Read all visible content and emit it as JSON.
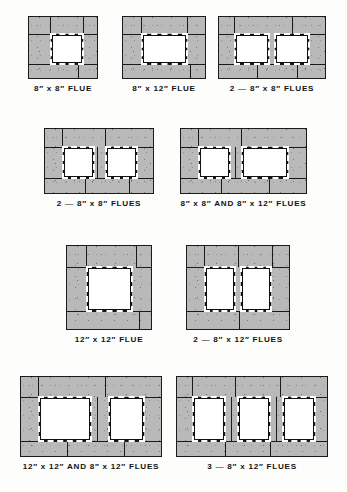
{
  "sheet": {
    "title": "Masonry Chimney Flue Arrangements",
    "background_color": "#fdfdfb",
    "masonry_color": "#b9b9b9",
    "mortar_color": "#1a1a1a",
    "flue_color": "#ffffff"
  },
  "figures": [
    {
      "id": "fig-8x8-flue",
      "caption": "8″ x 8″ FLUE",
      "flue_count": 1,
      "flue_sizes": [
        "8″ x 8″"
      ],
      "x": 28,
      "y": 16,
      "w": 70,
      "h": 63,
      "flues": [
        {
          "x": 22,
          "y": 17,
          "w": 32,
          "h": 30
        }
      ],
      "joints": [
        {
          "o": "v",
          "x": 21,
          "y": 0,
          "len": 17
        },
        {
          "o": "h",
          "x": 0,
          "y": 17,
          "len": 22
        },
        {
          "o": "v",
          "x": 54,
          "y": 0,
          "len": 17
        },
        {
          "o": "h",
          "x": 54,
          "y": 17,
          "len": 16
        },
        {
          "o": "h",
          "x": 0,
          "y": 47,
          "len": 22
        },
        {
          "o": "v",
          "x": 49,
          "y": 47,
          "len": 16
        },
        {
          "o": "h",
          "x": 22,
          "y": 47,
          "len": 48
        }
      ],
      "caption_y": 84
    },
    {
      "id": "fig-8x12-flue",
      "caption": "8″ x 12″ FLUE",
      "flue_count": 1,
      "flue_sizes": [
        "8″ x 12″"
      ],
      "x": 122,
      "y": 16,
      "w": 84,
      "h": 63,
      "flues": [
        {
          "x": 19,
          "y": 17,
          "w": 45,
          "h": 30
        }
      ],
      "joints": [
        {
          "o": "v",
          "x": 18,
          "y": 0,
          "len": 17
        },
        {
          "o": "h",
          "x": 0,
          "y": 17,
          "len": 19
        },
        {
          "o": "v",
          "x": 64,
          "y": 0,
          "len": 17
        },
        {
          "o": "h",
          "x": 64,
          "y": 17,
          "len": 20
        },
        {
          "o": "h",
          "x": 0,
          "y": 47,
          "len": 19
        },
        {
          "o": "h",
          "x": 19,
          "y": 47,
          "len": 65
        },
        {
          "o": "v",
          "x": 67,
          "y": 47,
          "len": 16
        }
      ],
      "caption_y": 84
    },
    {
      "id": "fig-2-8x8-flues-a",
      "caption": "2 — 8″ x 8″ FLUES",
      "flue_count": 2,
      "flue_sizes": [
        "8″ x 8″",
        "8″ x 8″"
      ],
      "x": 218,
      "y": 16,
      "w": 108,
      "h": 63,
      "flues": [
        {
          "x": 16,
          "y": 17,
          "w": 34,
          "h": 30
        },
        {
          "x": 56,
          "y": 17,
          "w": 34,
          "h": 30
        }
      ],
      "joints": [
        {
          "o": "v",
          "x": 15,
          "y": 0,
          "len": 17
        },
        {
          "o": "v",
          "x": 73,
          "y": 0,
          "len": 17
        },
        {
          "o": "h",
          "x": 0,
          "y": 17,
          "len": 16
        },
        {
          "o": "h",
          "x": 90,
          "y": 17,
          "len": 18
        },
        {
          "o": "h",
          "x": 0,
          "y": 47,
          "len": 16
        },
        {
          "o": "h",
          "x": 90,
          "y": 47,
          "len": 18
        },
        {
          "o": "h",
          "x": 16,
          "y": 47,
          "len": 74
        },
        {
          "o": "v",
          "x": 38,
          "y": 47,
          "len": 16
        },
        {
          "o": "v",
          "x": 78,
          "y": 47,
          "len": 16
        }
      ],
      "caption_y": 84
    },
    {
      "id": "fig-2-8x8-flues-b",
      "caption": "2 — 8″ x 8″ FLUES",
      "flue_count": 2,
      "flue_sizes": [
        "8″ x 8″",
        "8″ x 8″"
      ],
      "x": 44,
      "y": 128,
      "w": 110,
      "h": 66,
      "flues": [
        {
          "x": 18,
          "y": 18,
          "w": 31,
          "h": 31
        },
        {
          "x": 61,
          "y": 18,
          "w": 31,
          "h": 31
        }
      ],
      "joints": [
        {
          "o": "v",
          "x": 17,
          "y": 0,
          "len": 18
        },
        {
          "o": "v",
          "x": 60,
          "y": 0,
          "len": 18
        },
        {
          "o": "h",
          "x": 0,
          "y": 18,
          "len": 18
        },
        {
          "o": "h",
          "x": 92,
          "y": 18,
          "len": 18
        },
        {
          "o": "h",
          "x": 0,
          "y": 49,
          "len": 18
        },
        {
          "o": "h",
          "x": 92,
          "y": 49,
          "len": 18
        },
        {
          "o": "h",
          "x": 18,
          "y": 49,
          "len": 74
        },
        {
          "o": "v",
          "x": 40,
          "y": 49,
          "len": 17
        },
        {
          "o": "v",
          "x": 84,
          "y": 49,
          "len": 17
        },
        {
          "o": "v",
          "x": 52,
          "y": 18,
          "len": 31
        }
      ],
      "caption_y": 199
    },
    {
      "id": "fig-8x8-and-8x12-flues",
      "caption": "8″ x 8″ AND 8″ x 12″ FLUES",
      "flue_count": 2,
      "flue_sizes": [
        "8″ x 8″",
        "8″ x 12″"
      ],
      "x": 180,
      "y": 128,
      "w": 127,
      "h": 66,
      "flues": [
        {
          "x": 18,
          "y": 18,
          "w": 31,
          "h": 31
        },
        {
          "x": 61,
          "y": 18,
          "w": 46,
          "h": 31
        }
      ],
      "joints": [
        {
          "o": "v",
          "x": 17,
          "y": 0,
          "len": 18
        },
        {
          "o": "v",
          "x": 60,
          "y": 0,
          "len": 18
        },
        {
          "o": "h",
          "x": 0,
          "y": 18,
          "len": 18
        },
        {
          "o": "h",
          "x": 107,
          "y": 18,
          "len": 20
        },
        {
          "o": "h",
          "x": 0,
          "y": 49,
          "len": 18
        },
        {
          "o": "h",
          "x": 107,
          "y": 49,
          "len": 20
        },
        {
          "o": "h",
          "x": 18,
          "y": 49,
          "len": 89
        },
        {
          "o": "v",
          "x": 40,
          "y": 49,
          "len": 17
        },
        {
          "o": "v",
          "x": 88,
          "y": 49,
          "len": 17
        },
        {
          "o": "v",
          "x": 54,
          "y": 18,
          "len": 31
        }
      ],
      "caption_y": 199
    },
    {
      "id": "fig-12x12-flue",
      "caption": "12″ x 12″ FLUE",
      "flue_count": 1,
      "flue_sizes": [
        "12″ x 12″"
      ],
      "x": 66,
      "y": 245,
      "w": 86,
      "h": 85,
      "flues": [
        {
          "x": 20,
          "y": 21,
          "w": 45,
          "h": 44
        }
      ],
      "joints": [
        {
          "o": "v",
          "x": 19,
          "y": 0,
          "len": 21
        },
        {
          "o": "h",
          "x": 0,
          "y": 21,
          "len": 20
        },
        {
          "o": "v",
          "x": 69,
          "y": 0,
          "len": 21
        },
        {
          "o": "h",
          "x": 69,
          "y": 21,
          "len": 17
        },
        {
          "o": "h",
          "x": 0,
          "y": 65,
          "len": 20
        },
        {
          "o": "h",
          "x": 20,
          "y": 65,
          "len": 66
        },
        {
          "o": "v",
          "x": 72,
          "y": 65,
          "len": 20
        }
      ],
      "caption_y": 335
    },
    {
      "id": "fig-2-8x12-flues",
      "caption": "2 — 8″ x 12″ FLUES",
      "flue_count": 2,
      "flue_sizes": [
        "8″ x 12″",
        "8″ x 12″"
      ],
      "x": 186,
      "y": 245,
      "w": 104,
      "h": 85,
      "flues": [
        {
          "x": 18,
          "y": 21,
          "w": 30,
          "h": 44
        },
        {
          "x": 54,
          "y": 21,
          "w": 30,
          "h": 44
        }
      ],
      "joints": [
        {
          "o": "v",
          "x": 17,
          "y": 0,
          "len": 21
        },
        {
          "o": "v",
          "x": 51,
          "y": 0,
          "len": 21
        },
        {
          "o": "v",
          "x": 85,
          "y": 0,
          "len": 21
        },
        {
          "o": "h",
          "x": 0,
          "y": 21,
          "len": 18
        },
        {
          "o": "h",
          "x": 84,
          "y": 21,
          "len": 20
        },
        {
          "o": "h",
          "x": 0,
          "y": 65,
          "len": 18
        },
        {
          "o": "h",
          "x": 84,
          "y": 65,
          "len": 20
        },
        {
          "o": "h",
          "x": 18,
          "y": 65,
          "len": 66
        },
        {
          "o": "v",
          "x": 52,
          "y": 65,
          "len": 20
        }
      ],
      "caption_y": 335
    },
    {
      "id": "fig-12x12-and-8x12-flues",
      "caption": "12″ x 12″ AND 8″ x 12″ FLUES",
      "flue_count": 2,
      "flue_sizes": [
        "12″ x 12″",
        "8″ x 12″"
      ],
      "x": 20,
      "y": 376,
      "w": 142,
      "h": 81,
      "flues": [
        {
          "x": 18,
          "y": 20,
          "w": 52,
          "h": 44
        },
        {
          "x": 88,
          "y": 20,
          "w": 35,
          "h": 44
        }
      ],
      "joints": [
        {
          "o": "v",
          "x": 17,
          "y": 0,
          "len": 20
        },
        {
          "o": "v",
          "x": 84,
          "y": 0,
          "len": 20
        },
        {
          "o": "h",
          "x": 0,
          "y": 20,
          "len": 18
        },
        {
          "o": "h",
          "x": 123,
          "y": 20,
          "len": 19
        },
        {
          "o": "h",
          "x": 0,
          "y": 64,
          "len": 18
        },
        {
          "o": "h",
          "x": 123,
          "y": 64,
          "len": 19
        },
        {
          "o": "h",
          "x": 18,
          "y": 64,
          "len": 105
        },
        {
          "o": "v",
          "x": 46,
          "y": 64,
          "len": 17
        },
        {
          "o": "v",
          "x": 103,
          "y": 64,
          "len": 17
        },
        {
          "o": "v",
          "x": 76,
          "y": 20,
          "len": 44
        }
      ],
      "caption_y": 462
    },
    {
      "id": "fig-3-8x12-flues",
      "caption": "3 — 8″ x 12″ FLUES",
      "flue_count": 3,
      "flue_sizes": [
        "8″ x 12″",
        "8″ x 12″",
        "8″ x 12″"
      ],
      "x": 176,
      "y": 376,
      "w": 152,
      "h": 81,
      "flues": [
        {
          "x": 16,
          "y": 20,
          "w": 32,
          "h": 44
        },
        {
          "x": 61,
          "y": 20,
          "w": 32,
          "h": 44
        },
        {
          "x": 106,
          "y": 20,
          "w": 32,
          "h": 44
        }
      ],
      "joints": [
        {
          "o": "v",
          "x": 15,
          "y": 0,
          "len": 20
        },
        {
          "o": "v",
          "x": 58,
          "y": 0,
          "len": 20
        },
        {
          "o": "v",
          "x": 103,
          "y": 0,
          "len": 20
        },
        {
          "o": "h",
          "x": 0,
          "y": 20,
          "len": 16
        },
        {
          "o": "h",
          "x": 138,
          "y": 20,
          "len": 14
        },
        {
          "o": "h",
          "x": 0,
          "y": 64,
          "len": 16
        },
        {
          "o": "h",
          "x": 138,
          "y": 64,
          "len": 14
        },
        {
          "o": "h",
          "x": 16,
          "y": 64,
          "len": 122
        },
        {
          "o": "v",
          "x": 48,
          "y": 64,
          "len": 17
        },
        {
          "o": "v",
          "x": 93,
          "y": 64,
          "len": 17
        },
        {
          "o": "v",
          "x": 54,
          "y": 20,
          "len": 44
        },
        {
          "o": "v",
          "x": 99,
          "y": 20,
          "len": 44
        }
      ],
      "caption_y": 462
    }
  ]
}
